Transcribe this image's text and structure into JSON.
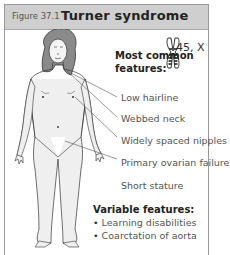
{
  "figure": {
    "label": "Figure 37.1",
    "title": "Turner syndrome"
  },
  "karyotype": "45, X",
  "common": {
    "heading_line1": "Most common",
    "heading_line2": "features:",
    "items": [
      "Low hairline",
      "Webbed neck",
      "Widely spaced nipples",
      "Primary ovarian failure",
      "Short stature"
    ]
  },
  "variable": {
    "heading": "Variable features:",
    "items": [
      "Learning disabilities",
      "Coarctation of aorta"
    ]
  },
  "icons": {
    "chromosome": "chromosome-x-icon",
    "figure": "female-body-illustration"
  }
}
